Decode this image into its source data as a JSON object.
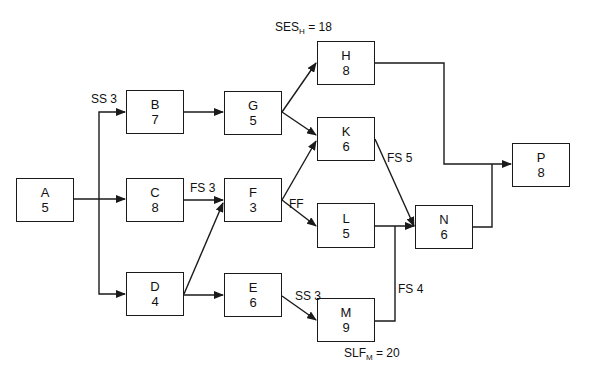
{
  "diagram": {
    "type": "precedence-network",
    "nodes": [
      {
        "id": "A",
        "duration": "5",
        "x": 16,
        "y": 178,
        "w": 58,
        "h": 44
      },
      {
        "id": "B",
        "duration": "7",
        "x": 126,
        "y": 90,
        "w": 58,
        "h": 44
      },
      {
        "id": "C",
        "duration": "8",
        "x": 126,
        "y": 178,
        "w": 58,
        "h": 44
      },
      {
        "id": "D",
        "duration": "4",
        "x": 126,
        "y": 272,
        "w": 58,
        "h": 44
      },
      {
        "id": "G",
        "duration": "5",
        "x": 224,
        "y": 91,
        "w": 58,
        "h": 44
      },
      {
        "id": "F",
        "duration": "3",
        "x": 224,
        "y": 178,
        "w": 58,
        "h": 44
      },
      {
        "id": "E",
        "duration": "6",
        "x": 224,
        "y": 273,
        "w": 58,
        "h": 44
      },
      {
        "id": "H",
        "duration": "8",
        "x": 317,
        "y": 41,
        "w": 58,
        "h": 44
      },
      {
        "id": "K",
        "duration": "6",
        "x": 317,
        "y": 117,
        "w": 58,
        "h": 44
      },
      {
        "id": "L",
        "duration": "5",
        "x": 317,
        "y": 203,
        "w": 58,
        "h": 45
      },
      {
        "id": "M",
        "duration": "9",
        "x": 317,
        "y": 298,
        "w": 58,
        "h": 44
      },
      {
        "id": "N",
        "duration": "6",
        "x": 415,
        "y": 205,
        "w": 58,
        "h": 44
      },
      {
        "id": "P",
        "duration": "8",
        "x": 512,
        "y": 143,
        "w": 58,
        "h": 44
      }
    ],
    "edges": [
      {
        "from": "A",
        "to": "B",
        "label": "SS 3"
      },
      {
        "from": "A",
        "to": "C",
        "label": ""
      },
      {
        "from": "A",
        "to": "D",
        "label": ""
      },
      {
        "from": "B",
        "to": "G",
        "label": ""
      },
      {
        "from": "C",
        "to": "F",
        "label": "FS 3"
      },
      {
        "from": "D",
        "to": "F",
        "label": ""
      },
      {
        "from": "D",
        "to": "E",
        "label": ""
      },
      {
        "from": "G",
        "to": "H",
        "label": ""
      },
      {
        "from": "G",
        "to": "K",
        "label": ""
      },
      {
        "from": "F",
        "to": "K",
        "label": ""
      },
      {
        "from": "F",
        "to": "L",
        "label": "FF"
      },
      {
        "from": "E",
        "to": "M",
        "label": "SS 3"
      },
      {
        "from": "K",
        "to": "N",
        "label": "FS 5"
      },
      {
        "from": "L",
        "to": "N",
        "label": ""
      },
      {
        "from": "M",
        "to": "N",
        "label": "FS 4"
      },
      {
        "from": "H",
        "to": "P",
        "label": ""
      },
      {
        "from": "N",
        "to": "P",
        "label": ""
      }
    ],
    "labels": {
      "ss3_ab": "SS 3",
      "fs3_cf": "FS 3",
      "ff_fl": "FF",
      "fs5_kn": "FS 5",
      "ss3_em": "SS 3",
      "fs4_mn": "FS 4",
      "ses_h": {
        "prefix": "SES",
        "sub": "H",
        "suffix": " = 18"
      },
      "slf_m": {
        "prefix": "SLF",
        "sub": "M",
        "suffix": " = 20"
      }
    },
    "colors": {
      "line": "#1a1a1a",
      "background": "#ffffff"
    }
  }
}
